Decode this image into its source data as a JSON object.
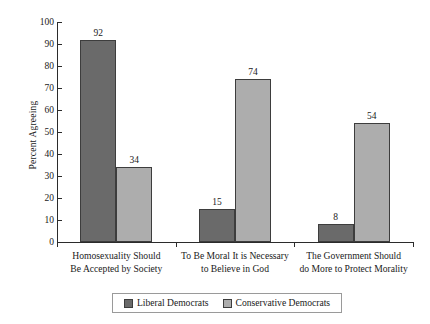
{
  "chart_data": {
    "type": "bar",
    "title": "",
    "xlabel": "",
    "ylabel": "Percent Agreeing",
    "ylim": [
      0,
      100
    ],
    "ytick_step": 10,
    "grid": false,
    "legend_position": "bottom",
    "categories": [
      "Homosexuality Should Be Accepted by Society",
      "To Be Moral It is Necessary to Believe in God",
      "The Government Should do More to Protect Morality"
    ],
    "category_lines": [
      [
        "Homosexuality Should",
        "Be Accepted by Society"
      ],
      [
        "To Be Moral It is Necessary",
        "to Believe in God"
      ],
      [
        "The Government Should",
        "do More to Protect Morality"
      ]
    ],
    "series": [
      {
        "name": "Liberal Democrats",
        "color": "#6a6a6a",
        "values": [
          92,
          15,
          8
        ]
      },
      {
        "name": "Conservative Democrats",
        "color": "#adadad",
        "values": [
          34,
          74,
          54
        ]
      }
    ],
    "yticks": [
      {
        "value": 100,
        "label": "100"
      },
      {
        "value": 90,
        "label": "90"
      },
      {
        "value": 80,
        "label": "80"
      },
      {
        "value": 70,
        "label": "70"
      },
      {
        "value": 60,
        "label": "60"
      },
      {
        "value": 50,
        "label": "50"
      },
      {
        "value": 40,
        "label": "40"
      },
      {
        "value": 30,
        "label": "30"
      },
      {
        "value": 20,
        "label": "20"
      },
      {
        "value": 10,
        "label": "10"
      },
      {
        "value": 0,
        "label": "0"
      }
    ],
    "bar_labels": [
      {
        "text": "92"
      },
      {
        "text": "34"
      },
      {
        "text": "15"
      },
      {
        "text": "74"
      },
      {
        "text": "8"
      },
      {
        "text": "54"
      }
    ]
  },
  "legend": {
    "items": [
      {
        "label": "Liberal Democrats",
        "color": "#6a6a6a"
      },
      {
        "label": "Conservative Democrats",
        "color": "#adadad"
      }
    ]
  },
  "axis": {
    "y_title": "Percent Agreeing"
  }
}
